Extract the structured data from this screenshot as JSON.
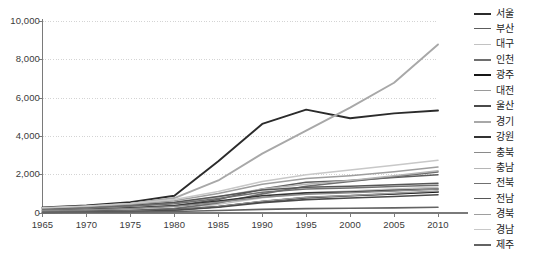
{
  "chart_data": {
    "type": "line",
    "title": "",
    "subtitle": "",
    "xlabel": "",
    "ylabel": "",
    "xlim": [
      1965,
      2010
    ],
    "ylim": [
      0,
      10000
    ],
    "grid": true,
    "legend_position": "right",
    "x": [
      1965,
      1970,
      1975,
      1980,
      1985,
      1990,
      1995,
      2000,
      2005,
      2010
    ],
    "y_ticks": [
      0,
      2000,
      4000,
      6000,
      8000,
      10000
    ],
    "y_tick_labels": [
      "0",
      "2,000",
      "4,000",
      "6,000",
      "8,000",
      "10,000"
    ],
    "x_ticks": [
      1965,
      1970,
      1975,
      1980,
      1985,
      1990,
      1995,
      2000,
      2005,
      2010
    ],
    "x_tick_labels": [
      "1965",
      "1970",
      "1975",
      "1980",
      "1985",
      "1990",
      "1995",
      "2000",
      "2005",
      "2010"
    ],
    "series": [
      {
        "name": "서울",
        "color": "#2b2b2b",
        "width": 1.9,
        "values": [
          290,
          400,
          570,
          900,
          2700,
          4650,
          5400,
          4950,
          5200,
          5350
        ]
      },
      {
        "name": "부산",
        "color": "#5c5c5c",
        "width": 1.5,
        "values": [
          120,
          170,
          250,
          380,
          700,
          1250,
          1600,
          1700,
          1850,
          2000
        ]
      },
      {
        "name": "대구",
        "color": "#c2c2c2",
        "width": 1.5,
        "values": [
          70,
          100,
          150,
          230,
          450,
          800,
          1050,
          1150,
          1250,
          1350
        ]
      },
      {
        "name": "인천",
        "color": "#6e6e6e",
        "width": 1.6,
        "values": [
          60,
          90,
          140,
          230,
          520,
          1000,
          1400,
          1650,
          1900,
          2150
        ]
      },
      {
        "name": "광주",
        "color": "#161616",
        "width": 1.7,
        "values": [
          50,
          70,
          100,
          160,
          330,
          600,
          800,
          900,
          1000,
          1100
        ]
      },
      {
        "name": "대전",
        "color": "#9a9a9a",
        "width": 1.5,
        "values": [
          50,
          70,
          100,
          160,
          330,
          620,
          820,
          920,
          1030,
          1150
        ]
      },
      {
        "name": "울산",
        "color": "#4a4a4a",
        "width": 1.6,
        "values": [
          30,
          50,
          80,
          140,
          300,
          540,
          700,
          780,
          860,
          950
        ]
      },
      {
        "name": "경기",
        "color": "#a8a8a8",
        "width": 1.9,
        "values": [
          230,
          330,
          490,
          780,
          1700,
          3100,
          4300,
          5500,
          6800,
          8800
        ]
      },
      {
        "name": "강원",
        "color": "#333333",
        "width": 1.6,
        "values": [
          150,
          200,
          270,
          380,
          620,
          900,
          1050,
          1100,
          1180,
          1250
        ]
      },
      {
        "name": "충북",
        "color": "#8a8a8a",
        "width": 1.5,
        "values": [
          130,
          175,
          240,
          340,
          560,
          820,
          980,
          1060,
          1150,
          1250
        ]
      },
      {
        "name": "충남",
        "color": "#b5b5b5",
        "width": 1.5,
        "values": [
          210,
          275,
          370,
          520,
          850,
          1250,
          1500,
          1700,
          1950,
          2200
        ]
      },
      {
        "name": "전북",
        "color": "#707070",
        "width": 1.5,
        "values": [
          200,
          260,
          350,
          480,
          760,
          1080,
          1250,
          1300,
          1380,
          1450
        ]
      },
      {
        "name": "전남",
        "color": "#565656",
        "width": 1.5,
        "values": [
          250,
          320,
          420,
          560,
          860,
          1200,
          1350,
          1400,
          1470,
          1550
        ]
      },
      {
        "name": "경북",
        "color": "#9e9e9e",
        "width": 1.5,
        "values": [
          260,
          340,
          460,
          640,
          1020,
          1500,
          1800,
          1950,
          2150,
          2400
        ]
      },
      {
        "name": "경남",
        "color": "#c8c8c8",
        "width": 1.5,
        "values": [
          280,
          370,
          500,
          700,
          1120,
          1650,
          2000,
          2250,
          2500,
          2750
        ]
      },
      {
        "name": "제주",
        "color": "#636363",
        "width": 1.6,
        "values": [
          30,
          40,
          55,
          80,
          130,
          190,
          230,
          250,
          270,
          300
        ]
      }
    ]
  }
}
